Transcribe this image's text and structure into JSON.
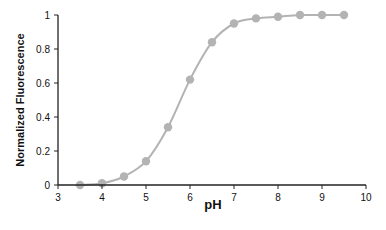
{
  "chart_data": {
    "type": "line",
    "title": "",
    "xlabel": "pH",
    "ylabel": "Normalized Fluorescence",
    "xlim": [
      3,
      10
    ],
    "ylim": [
      0,
      1
    ],
    "x_ticks": [
      3,
      4,
      5,
      6,
      7,
      8,
      9,
      10
    ],
    "y_ticks": [
      0,
      0.2,
      0.4,
      0.6,
      0.8,
      1
    ],
    "y_tick_labels": [
      "0",
      "0.2",
      "0.4",
      "0.6",
      "0.8",
      "1"
    ],
    "x_tick_labels": [
      "3",
      "4",
      "5",
      "6",
      "7",
      "8",
      "9",
      "10"
    ],
    "grid": false,
    "legend": null,
    "series": [
      {
        "name": "Normalized Fluorescence",
        "color": "#b3b3b3",
        "marker": "circle",
        "smooth": true,
        "x": [
          3.5,
          4.0,
          4.5,
          5.0,
          5.5,
          6.0,
          6.5,
          7.0,
          7.5,
          8.0,
          8.5,
          9.0,
          9.5
        ],
        "values": [
          0.0,
          0.01,
          0.05,
          0.14,
          0.34,
          0.62,
          0.84,
          0.95,
          0.98,
          0.99,
          1.0,
          1.0,
          1.0
        ]
      }
    ]
  },
  "labels": {
    "xlabel": "pH",
    "ylabel": "Normalized Fluorescence"
  }
}
